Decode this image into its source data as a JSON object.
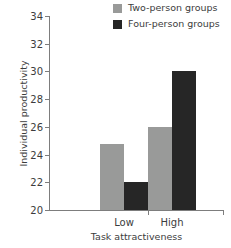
{
  "chart_data": {
    "type": "bar",
    "title": "",
    "xlabel": "Task attractiveness",
    "ylabel": "Individual productivity",
    "categories": [
      "Low",
      "High"
    ],
    "series": [
      {
        "name": "Two-person groups",
        "color": "#999a99",
        "values": [
          24.8,
          26.0
        ]
      },
      {
        "name": "Four-person groups",
        "color": "#262626",
        "values": [
          22.0,
          30.0
        ]
      }
    ],
    "ylim": [
      20,
      34
    ],
    "yticks": [
      20,
      22,
      24,
      26,
      28,
      30,
      32,
      34
    ],
    "ytick_labels": [
      "20",
      "22",
      "24",
      "26",
      "28",
      "30",
      "32",
      "34"
    ],
    "grid": false,
    "legend_position": "top-right",
    "axis_color": "#7d7d7d"
  },
  "legend": {
    "items": [
      {
        "label": "Two-person groups",
        "swatch": "#999a99"
      },
      {
        "label": "Four-person groups",
        "swatch": "#262626"
      }
    ]
  },
  "axes": {
    "y_title": "Individual productivity",
    "x_title": "Task attractiveness"
  }
}
